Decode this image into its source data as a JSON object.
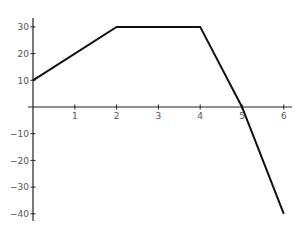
{
  "chart_data": {
    "type": "line",
    "title": "",
    "xlabel": "",
    "ylabel": "",
    "x": [
      0,
      2,
      4,
      5,
      6
    ],
    "series": [
      {
        "name": "",
        "values": [
          10,
          30,
          30,
          0,
          -40
        ]
      }
    ],
    "xlim": [
      0,
      6.2
    ],
    "ylim": [
      -41,
      31
    ],
    "x_ticks": [
      1,
      2,
      3,
      4,
      5,
      6
    ],
    "y_ticks": [
      30,
      20,
      10,
      -10,
      -20,
      -30,
      -40
    ],
    "grid": false,
    "legend": null,
    "line_color": "#111111",
    "axis_color": "#222222"
  }
}
